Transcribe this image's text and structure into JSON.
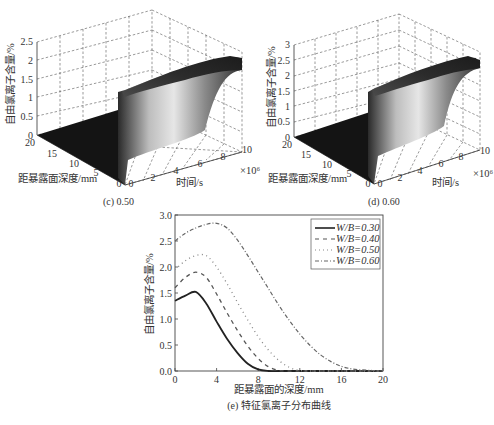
{
  "panels": {
    "c": {
      "caption": "(c) 0.50",
      "zlabel": "自由氯离子含量/%",
      "ylabel": "距暴露面深度/mm",
      "xlabel": "时间/s",
      "x_multiplier": "×10⁶",
      "z_ticks": [
        "0",
        "0.5",
        "1",
        "1.5",
        "2",
        "2.5"
      ],
      "y_ticks": [
        "20",
        "15",
        "10",
        "5",
        "0"
      ],
      "x_ticks": [
        "0",
        "2",
        "4",
        "6",
        "8",
        "10"
      ]
    },
    "d": {
      "caption": "(d) 0.60",
      "zlabel": "自由氯离子含量/%",
      "ylabel": "距暴露面深度/mm",
      "xlabel": "时间/s",
      "x_multiplier": "×10⁶",
      "z_ticks": [
        "0",
        "0.5",
        "1",
        "1.5",
        "2",
        "2.5",
        "3"
      ],
      "y_ticks": [
        "20",
        "15",
        "10",
        "5",
        "0"
      ],
      "x_ticks": [
        "0",
        "2",
        "4",
        "6",
        "8",
        "10"
      ]
    },
    "e": {
      "caption": "(e) 特征氯离子分布曲线",
      "xlabel": "距暴露面的深度/mm",
      "ylabel": "自由氯离子含量/%",
      "x_ticks": [
        "0",
        "4",
        "8",
        "12",
        "16",
        "20"
      ],
      "y_ticks": [
        "0.0",
        "0.5",
        "1.0",
        "1.5",
        "2.0",
        "2.5",
        "3.0"
      ],
      "legend": [
        "W/B=0.30",
        "W/B=0.40",
        "W/B=0.50",
        "W/B=0.60"
      ]
    }
  },
  "chart_data": [
    {
      "type": "surface",
      "title": "(c) 0.50",
      "xlabel": "时间/s (×10⁶)",
      "ylabel": "距暴露面深度/mm",
      "zlabel": "自由氯离子含量/%",
      "xlim": [
        0,
        10
      ],
      "ylim": [
        0,
        20
      ],
      "zlim": [
        0,
        2.5
      ],
      "grid": true,
      "description": "Surface rises sharply near time 0 and stays as a ridge along time axis near depth 0; peak ~2.2 at depth ~2 mm"
    },
    {
      "type": "surface",
      "title": "(d) 0.60",
      "xlabel": "时间/s (×10⁶)",
      "ylabel": "距暴露面深度/mm",
      "zlabel": "自由氯离子含量/%",
      "xlim": [
        0,
        10
      ],
      "ylim": [
        0,
        20
      ],
      "zlim": [
        0,
        3
      ],
      "grid": true,
      "description": "Surface rises sharply near time 0 with ridge along time axis; peak ~2.8 near depth ~4 mm"
    },
    {
      "type": "line",
      "title": "(e) 特征氯离子分布曲线",
      "xlabel": "距暴露面的深度/mm",
      "ylabel": "自由氯离子含量/%",
      "xlim": [
        0,
        20
      ],
      "ylim": [
        0,
        3.0
      ],
      "legend_position": "upper right",
      "x": [
        0,
        1,
        2,
        3,
        4,
        5,
        6,
        7,
        8,
        9,
        10,
        11,
        12,
        13,
        14,
        15,
        16,
        17,
        18,
        19,
        20
      ],
      "series": [
        {
          "name": "W/B=0.30",
          "style": "solid",
          "values": [
            1.35,
            1.45,
            1.52,
            1.3,
            0.95,
            0.62,
            0.35,
            0.14,
            0.03,
            0.0,
            0.0,
            0.0,
            0.0,
            0.0,
            0.0,
            0.0,
            0.0,
            0.0,
            0.0,
            0.0,
            0.0
          ]
        },
        {
          "name": "W/B=0.40",
          "style": "dash",
          "values": [
            1.6,
            1.8,
            1.9,
            1.8,
            1.48,
            1.12,
            0.78,
            0.48,
            0.24,
            0.08,
            0.01,
            0.0,
            0.0,
            0.0,
            0.0,
            0.0,
            0.0,
            0.0,
            0.0,
            0.0,
            0.0
          ]
        },
        {
          "name": "W/B=0.50",
          "style": "dot",
          "values": [
            1.95,
            2.12,
            2.22,
            2.22,
            2.0,
            1.68,
            1.32,
            0.98,
            0.66,
            0.4,
            0.2,
            0.07,
            0.01,
            0.0,
            0.0,
            0.0,
            0.0,
            0.0,
            0.0,
            0.0,
            0.0
          ]
        },
        {
          "name": "W/B=0.60",
          "style": "dashdot",
          "values": [
            2.5,
            2.65,
            2.75,
            2.82,
            2.84,
            2.75,
            2.52,
            2.22,
            1.9,
            1.58,
            1.26,
            0.97,
            0.71,
            0.49,
            0.31,
            0.18,
            0.09,
            0.04,
            0.02,
            0.01,
            0.0
          ]
        }
      ]
    }
  ]
}
